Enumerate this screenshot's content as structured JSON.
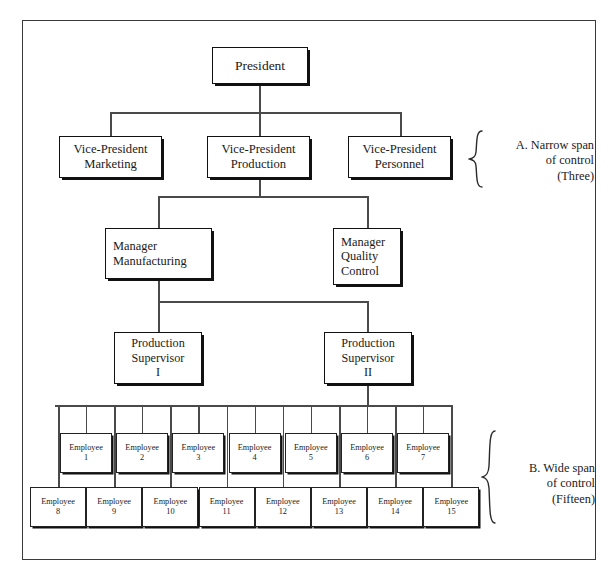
{
  "diagram": {
    "frame": {
      "border_color": "#3a3a3a"
    },
    "president": {
      "label": "President"
    },
    "vice_presidents": [
      {
        "line1": "Vice-President",
        "line2": "Marketing"
      },
      {
        "line1": "Vice-President",
        "line2": "Production"
      },
      {
        "line1": "Vice-President",
        "line2": "Personnel"
      }
    ],
    "managers": [
      {
        "line1": "Manager",
        "line2": "Manufacturing",
        "line3": ""
      },
      {
        "line1": "Manager",
        "line2": "Quality",
        "line3": "Control"
      }
    ],
    "supervisors": [
      {
        "line1": "Production",
        "line2": "Supervisor",
        "line3": "I"
      },
      {
        "line1": "Production",
        "line2": "Supervisor",
        "line3": "II"
      }
    ],
    "employee_label": "Employee",
    "employees_row1": [
      {
        "label": "Employee",
        "number": "1"
      },
      {
        "label": "Employee",
        "number": "2"
      },
      {
        "label": "Employee",
        "number": "3"
      },
      {
        "label": "Employee",
        "number": "4"
      },
      {
        "label": "Employee",
        "number": "5"
      },
      {
        "label": "Employee",
        "number": "6"
      },
      {
        "label": "Employee",
        "number": "7"
      }
    ],
    "employees_row2": [
      {
        "label": "Employee",
        "number": "8"
      },
      {
        "label": "Employee",
        "number": "9"
      },
      {
        "label": "Employee",
        "number": "10"
      },
      {
        "label": "Employee",
        "number": "11"
      },
      {
        "label": "Employee",
        "number": "12"
      },
      {
        "label": "Employee",
        "number": "13"
      },
      {
        "label": "Employee",
        "number": "14"
      },
      {
        "label": "Employee",
        "number": "15"
      }
    ],
    "annotations": [
      {
        "id": "A",
        "line1": "A. Narrow span",
        "line2": "of control",
        "line3": "(Three)"
      },
      {
        "id": "B",
        "line1": "B. Wide span",
        "line2": "of control",
        "line3": "(Fifteen)"
      }
    ]
  }
}
